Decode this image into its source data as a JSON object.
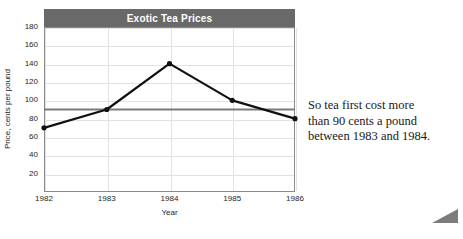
{
  "chart_data": {
    "type": "line",
    "title": "Exotic Tea Prices",
    "xlabel": "Year",
    "ylabel": "Price, cents per pound",
    "categories": [
      "1982",
      "1983",
      "1984",
      "1985",
      "1986"
    ],
    "x": [
      1982,
      1983,
      1984,
      1985,
      1986
    ],
    "values": [
      70,
      90,
      140,
      100,
      80
    ],
    "series": [
      {
        "name": "Price",
        "values": [
          70,
          90,
          140,
          100,
          80
        ],
        "color": "#111111",
        "marker": "circle"
      }
    ],
    "xlim": [
      1982,
      1986
    ],
    "ylim": [
      0,
      180
    ],
    "yticks": [
      180,
      160,
      140,
      120,
      100,
      80,
      60,
      40,
      20
    ],
    "ytick_labels": [
      "180",
      "160",
      "140",
      "120",
      "100",
      "80",
      "60",
      "40",
      "20"
    ],
    "xtick_labels": [
      "1982",
      "1983",
      "1984",
      "1985",
      "1986"
    ],
    "grid": true,
    "legend": "none",
    "reference_line": {
      "label": "90 cents",
      "value": 90,
      "orientation": "horizontal",
      "color": "#7a7a7a"
    },
    "colors": {
      "title_band": "#696969",
      "title_text": "#ffffff",
      "grid": "#e2e2e2",
      "frame": "#8a8a8a",
      "line": "#111111",
      "reference": "#7a7a7a",
      "text": "#1d1d1d"
    }
  },
  "annotation": {
    "line1": "So tea first cost more",
    "line2": "than 90 cents a pound",
    "line3": "between 1983 and 1984."
  },
  "decoration": {
    "corner_marker": "corner-triangle"
  }
}
